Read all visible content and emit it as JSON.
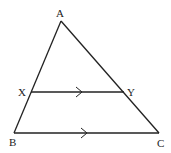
{
  "diagram": {
    "type": "geometry-triangle",
    "stroke_color": "#222222",
    "background": "#ffffff",
    "vertices": {
      "A": {
        "label": "A",
        "x": 61,
        "y": 21
      },
      "B": {
        "label": "B",
        "x": 14,
        "y": 133
      },
      "C": {
        "label": "C",
        "x": 159,
        "y": 133
      },
      "X": {
        "label": "X",
        "x": 31,
        "y": 92
      },
      "Y": {
        "label": "Y",
        "x": 124,
        "y": 92
      }
    },
    "segments": [
      {
        "from": "A",
        "to": "B"
      },
      {
        "from": "A",
        "to": "C"
      },
      {
        "from": "B",
        "to": "C",
        "parallel_marker": "single-arrow"
      },
      {
        "from": "X",
        "to": "Y",
        "parallel_marker": "single-arrow"
      }
    ],
    "labels": {
      "a": "A",
      "b": "B",
      "c": "C",
      "x": "X",
      "y": "Y"
    },
    "annotation": "XY parallel to BC"
  }
}
